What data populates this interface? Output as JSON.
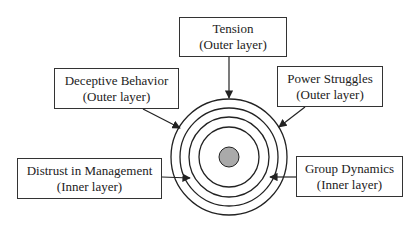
{
  "diagram": {
    "center": {
      "x": 229,
      "y": 157,
      "dot_radius": 10,
      "dot_color": "#aaaaaa"
    },
    "rings": [
      58,
      49,
      40,
      30
    ],
    "line_color": "#222222",
    "nodes": [
      {
        "id": "tension",
        "title": "Tension",
        "layer": "(Outer layer)",
        "box": {
          "x": 179,
          "y": 17,
          "w": 108,
          "h": 40
        },
        "arrow": {
          "x1": 229,
          "y1": 57,
          "x2": 229,
          "y2": 98
        }
      },
      {
        "id": "deceptive-behavior",
        "title": "Deceptive Behavior",
        "layer": "(Outer layer)",
        "box": {
          "x": 54,
          "y": 68,
          "w": 125,
          "h": 41
        },
        "arrow": {
          "x1": 143,
          "y1": 109,
          "x2": 180,
          "y2": 128
        }
      },
      {
        "id": "power-struggles",
        "title": "Power Struggles",
        "layer": "(Outer layer)",
        "box": {
          "x": 277,
          "y": 66,
          "w": 106,
          "h": 41
        },
        "arrow": {
          "x1": 305,
          "y1": 107,
          "x2": 279,
          "y2": 127
        }
      },
      {
        "id": "distrust-in-management",
        "title": "Distrust in Management",
        "layer": "(Inner layer)",
        "box": {
          "x": 17,
          "y": 158,
          "w": 145,
          "h": 41
        },
        "arrow": {
          "x1": 162,
          "y1": 177,
          "x2": 190,
          "y2": 178
        }
      },
      {
        "id": "group-dynamics",
        "title": "Group Dynamics",
        "layer": "(Inner layer)",
        "box": {
          "x": 296,
          "y": 156,
          "w": 107,
          "h": 41
        },
        "arrow": {
          "x1": 296,
          "y1": 177,
          "x2": 270,
          "y2": 177
        }
      }
    ]
  }
}
